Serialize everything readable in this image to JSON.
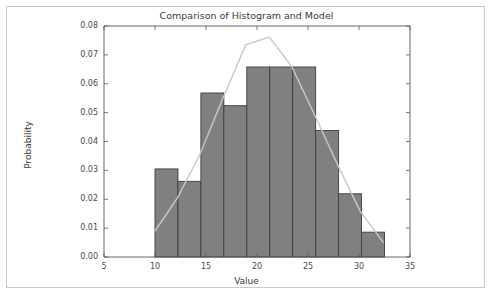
{
  "chart_data": {
    "type": "bar",
    "title": "Comparison of Histogram and Model",
    "xlabel": "Value",
    "ylabel": "Probability",
    "xlim": [
      5,
      35
    ],
    "ylim": [
      0.0,
      0.08
    ],
    "grid": false,
    "legend": null,
    "xticks": [
      5,
      10,
      15,
      20,
      25,
      30,
      35
    ],
    "xtick_labels": [
      "5",
      "10",
      "15",
      "20",
      "25",
      "30",
      "35"
    ],
    "yticks": [
      0.0,
      0.01,
      0.02,
      0.03,
      0.04,
      0.05,
      0.06,
      0.07,
      0.08
    ],
    "ytick_labels": [
      "0.00",
      "0.01",
      "0.02",
      "0.03",
      "0.04",
      "0.05",
      "0.06",
      "0.07",
      "0.08"
    ],
    "bar_color": "#808080",
    "bar_edge_color": "#3c3c3c",
    "line_color": "#c8c8c8",
    "bin_edges": [
      10.0,
      12.25,
      14.5,
      16.75,
      19.0,
      21.25,
      23.5,
      25.75,
      28.0,
      30.25,
      32.5
    ],
    "categories": [
      "10.0-12.25",
      "12.25-14.5",
      "14.5-16.75",
      "16.75-19.0",
      "19.0-21.25",
      "21.25-23.5",
      "23.5-25.75",
      "25.75-28.0",
      "28.0-30.25",
      "30.25-32.5"
    ],
    "values": [
      0.0305,
      0.0262,
      0.0568,
      0.0524,
      0.0658,
      0.0658,
      0.0658,
      0.0438,
      0.0219,
      0.0086
    ],
    "series": [
      {
        "name": "Histogram",
        "type": "bar",
        "values": [
          0.0305,
          0.0262,
          0.0568,
          0.0524,
          0.0658,
          0.0658,
          0.0658,
          0.0438,
          0.0219,
          0.0086
        ]
      },
      {
        "name": "Model",
        "type": "line",
        "x": [
          10.0,
          12.2,
          14.4,
          16.6,
          18.9,
          21.2,
          23.4,
          25.6,
          27.9,
          30.1,
          32.4
        ],
        "y": [
          0.009,
          0.0205,
          0.0355,
          0.0545,
          0.0735,
          0.0762,
          0.066,
          0.0495,
          0.032,
          0.016,
          0.005
        ]
      }
    ]
  }
}
